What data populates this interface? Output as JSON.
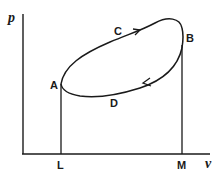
{
  "diagram": {
    "type": "pv-cycle",
    "axes": {
      "y_label": "p",
      "x_label": "v"
    },
    "points": {
      "A": "A",
      "B": "B",
      "C": "C",
      "D": "D",
      "L": "L",
      "M": "M"
    },
    "colors": {
      "line": "#1a1a1a",
      "background": "#ffffff"
    }
  }
}
